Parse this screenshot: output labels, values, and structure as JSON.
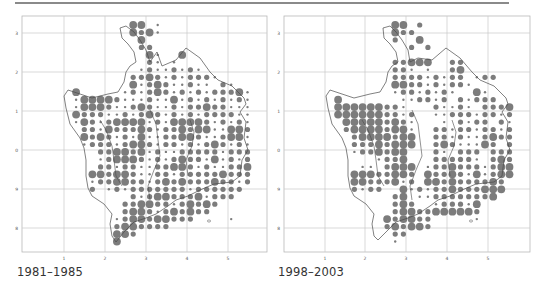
{
  "figure": {
    "panels": [
      {
        "caption": "1981–1985",
        "x_ticks": [
          "1",
          "2",
          "3",
          "4",
          "5"
        ],
        "y_ticks": [
          "3",
          "2",
          "1",
          "0",
          "9",
          "8"
        ]
      },
      {
        "caption": "1998–2003",
        "x_ticks": [
          "1",
          "2",
          "3",
          "4",
          "5"
        ],
        "y_ticks": [
          "3",
          "2",
          "1",
          "0",
          "9",
          "8"
        ]
      }
    ],
    "colors": {
      "dot": "#7c7c7c",
      "dot_edge": "#6a6a6a",
      "grid": "#c8c8c8",
      "frame": "#b8b8b8",
      "outline": "#4a4a4a",
      "tick_text": "#555555"
    }
  },
  "chart_data": [
    {
      "type": "scatter",
      "title": "1981–1985",
      "description": "Distribution map; grid squares with proportional gray dots (large / medium / small abundance classes)",
      "xlabel": "",
      "ylabel": "",
      "x_ticks": [
        "1",
        "2",
        "3",
        "4",
        "5"
      ],
      "y_ticks": [
        "3",
        "2",
        "1",
        "0",
        "9",
        "8"
      ],
      "grid": true,
      "dot_classes": {
        "L": "large",
        "M": "medium",
        "S": "small"
      },
      "rows": [
        "..............LL.S.............",
        "..............LMLS.............",
        "...............L...............",
        "...............MM..............",
        "................LS..L..........",
        "................MS.S...........",
        "...............SMSSMSMS........",
        "..............MMLMSMSMMMS......",
        "..............LSMLMSSMSS.MS....",
        ".......L.....SMSMLMSMSMSMMMLS..",
        ".......SLLLLMSSSMSSLSMSMSMSMS..",
        ".......SLLLMSSMLMSSMSMMLMMSSS..",
        ".......LMMMSSMSMLMSMSMSMMMMSS..",
        ".......SLMSMLLLLSMSLLLLMSMSMS..",
        "........MMSLMMMLMSMMLMLLSSLLM..",
        "........LMLMSMSLSSMMLLMSSMLLS..",
        "........SMMMSMLLMSMMSMSMLMSMS..",
        "..........MMLLMLSMSSMMMMMSMMM..",
        "..........SMLLLMSMSMLMMSLSMSM..",
        "..........MMSMMSSMMLLMSMSSMML..",
        ".........LLMLLMSSMMSMMMMMLMMM..",
        ".........SMMLLMMSMLMLMMMLMMSM..",
        ".........M.SMSMMMMMMMSMMMMMM...",
        "..............MSMLLMMMLSMMM....",
        ".............MMLLMMSMLMLM......",
        ".............MLLMSMLMLMM.......",
        "............SMLLMLLMMM....S....",
        "............MLLMMMM............",
        "............LLM................",
        "............L.................."
      ]
    },
    {
      "type": "scatter",
      "title": "1998–2003",
      "description": "Distribution map; grid squares with proportional gray dots (large / medium / small abundance classes)",
      "xlabel": "",
      "ylabel": "",
      "x_ticks": [
        "1",
        "2",
        "3",
        "4",
        "5"
      ],
      "y_ticks": [
        "3",
        "2",
        "1",
        "0",
        "9",
        "8"
      ],
      "grid": true,
      "dot_classes": {
        "L": "large",
        "M": "medium",
        "S": "small"
      },
      "rows": [
        "..............LL.M.............",
        "..............LMM..............",
        "..............M..L.............",
        "................M.M............",
        "...............................",
        "..............MMLLL..MM.......",
        "..............MMS.S..ML.......",
        "..............MMMMSMSMM.SMM...",
        "..............LLMMSMSMMS.......",
        "..............SMMSMSMS..LS.....",
        ".......L.......SSMMSM.MSMMM....",
        ".......LLLLLLMMS...MSSMS.MMML..",
        ".......LLLLLLMMSM..SSMMMSMMSM..",
        "........LLLLLMLMS...S.MSMM.MS..",
        "........MLLLLMLLS..MMSMMSMMSM..",
        ".........MLLLLMLL..MMSMSSMLMM..",
        ".........MMMLMLLL..MLMSSSLM.M..",
        ".........SMMLMLL...MS.MMM.MMM..",
        "............SMML...MMMMMS.MLM..",
        "..........SS.MLLL.SMMLMMMSMLL..",
        ".........LLLMMLLM.LMMLMSLSMLL..",
        ".........LLMMMLSM.LLMLMMMMLM...",
        ".........MSMM..LSMSMMLMMMLLL...",
        "..............ML.SSMMMMMMML....",
        "..............MLM..SMMMSL......",
        "..............MLLMMLLLLLM......",
        ".............LMLLMM.....S......",
        ".............MLMLLM............",
        "..............MM...............",
        "..............S................"
      ]
    }
  ]
}
